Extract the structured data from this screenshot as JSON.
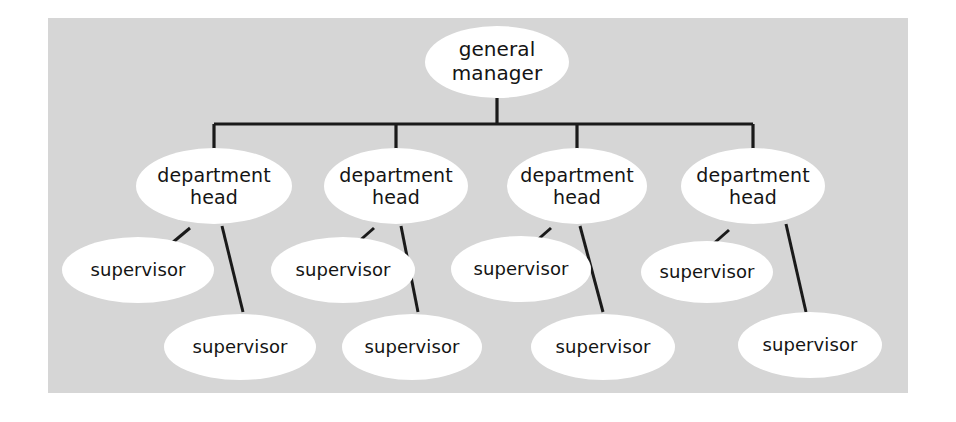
{
  "diagram": {
    "type": "organizational-chart",
    "background_color": "#ffffff",
    "panel_color": "#d6d6d6",
    "node_color": "#ffffff",
    "line_color": "#1a1a1a",
    "text_color": "#141414",
    "root": {
      "id": "general-manager",
      "label": "general\nmanager",
      "cx": 497,
      "cy": 62,
      "rx": 72,
      "ry": 36
    },
    "bus": {
      "stem_x": 497,
      "stem_top": 98,
      "bar_y": 124,
      "bar_left": 214,
      "bar_right": 753,
      "drop_bottom": 150
    },
    "department_heads": [
      {
        "id": "department-head-1",
        "label": "department\nhead",
        "cx": 214,
        "cy": 186,
        "rx": 78,
        "ry": 38
      },
      {
        "id": "department-head-2",
        "label": "department\nhead",
        "cx": 396,
        "cy": 186,
        "rx": 72,
        "ry": 38
      },
      {
        "id": "department-head-3",
        "label": "department\nhead",
        "cx": 577,
        "cy": 186,
        "rx": 70,
        "ry": 38
      },
      {
        "id": "department-head-4",
        "label": "department\nhead",
        "cx": 753,
        "cy": 186,
        "rx": 72,
        "ry": 38
      }
    ],
    "supervisors_upper": [
      {
        "id": "supervisor-1a",
        "label": "supervisor",
        "cx": 138,
        "cy": 270,
        "rx": 76,
        "ry": 33
      },
      {
        "id": "supervisor-2a",
        "label": "supervisor",
        "cx": 343,
        "cy": 270,
        "rx": 72,
        "ry": 33
      },
      {
        "id": "supervisor-3a",
        "label": "supervisor",
        "cx": 521,
        "cy": 269,
        "rx": 70,
        "ry": 33
      },
      {
        "id": "supervisor-4a",
        "label": "supervisor",
        "cx": 707,
        "cy": 272,
        "rx": 66,
        "ry": 31
      }
    ],
    "supervisors_lower": [
      {
        "id": "supervisor-1b",
        "label": "supervisor",
        "cx": 240,
        "cy": 347,
        "rx": 76,
        "ry": 33
      },
      {
        "id": "supervisor-2b",
        "label": "supervisor",
        "cx": 412,
        "cy": 347,
        "rx": 70,
        "ry": 33
      },
      {
        "id": "supervisor-3b",
        "label": "supervisor",
        "cx": 603,
        "cy": 347,
        "rx": 72,
        "ry": 33
      },
      {
        "id": "supervisor-4b",
        "label": "supervisor",
        "cx": 810,
        "cy": 345,
        "rx": 72,
        "ry": 33
      }
    ],
    "connectors": [
      {
        "id": "conn-dh1-sup1a",
        "x1": 190,
        "y1": 228,
        "x2": 172,
        "y2": 243
      },
      {
        "id": "conn-dh1-sup1b",
        "x1": 222,
        "y1": 226,
        "x2": 243,
        "y2": 312
      },
      {
        "id": "conn-dh2-sup2a",
        "x1": 374,
        "y1": 228,
        "x2": 357,
        "y2": 243
      },
      {
        "id": "conn-dh2-sup2b",
        "x1": 401,
        "y1": 226,
        "x2": 418,
        "y2": 312
      },
      {
        "id": "conn-dh3-sup3a",
        "x1": 551,
        "y1": 228,
        "x2": 534,
        "y2": 243
      },
      {
        "id": "conn-dh3-sup3b",
        "x1": 580,
        "y1": 226,
        "x2": 603,
        "y2": 312
      },
      {
        "id": "conn-dh4-sup4a",
        "x1": 729,
        "y1": 230,
        "x2": 712,
        "y2": 245
      },
      {
        "id": "conn-dh4-sup4b",
        "x1": 786,
        "y1": 224,
        "x2": 806,
        "y2": 312
      }
    ]
  }
}
